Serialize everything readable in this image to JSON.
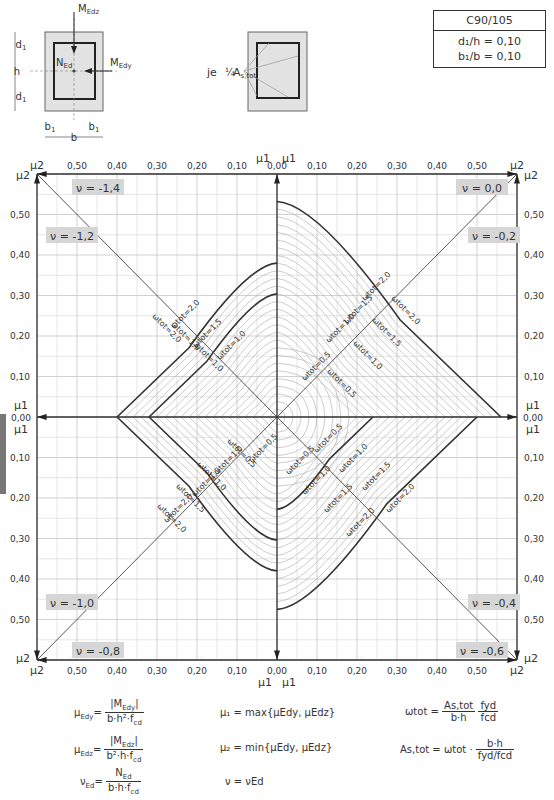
{
  "material_box": {
    "concrete_class": "C90/105",
    "ratio_d1_h": "d₁/h = 0,10",
    "ratio_b1_b": "b₁/b = 0,10"
  },
  "section_sketch": {
    "labels": {
      "mz": "M",
      "mz_sub": "Edz",
      "my": "M",
      "my_sub": "Edy",
      "n": "N",
      "n_sub": "Ed",
      "h": "h",
      "d1": "d",
      "b": "b",
      "b1": "b"
    },
    "reinforcement_label": "je",
    "reinforcement_fraction": "¼",
    "reinforcement_as": "A",
    "reinforcement_as_sub": "s,tot"
  },
  "chart_data": {
    "type": "line",
    "xlabel": "μ1 / μ2",
    "ylabel": "μ1 / μ2",
    "axis_range": [
      0.0,
      0.6
    ],
    "grid": true,
    "tick_labels": [
      "0,00",
      "0,10",
      "0,20",
      "0,30",
      "0,40",
      "0,50"
    ],
    "axis_end_labels": {
      "top_left": "μ2",
      "top_right": "μ2",
      "bottom_left": "μ2",
      "bottom_right": "μ2",
      "center": "μ1"
    },
    "quadrants": [
      {
        "position": "top-right",
        "nu_labels": [
          "ν = 0,0",
          "ν = -0,2"
        ]
      },
      {
        "position": "top-left",
        "nu_labels": [
          "ν = -1,4",
          "ν = -1,2"
        ]
      },
      {
        "position": "bottom-left",
        "nu_labels": [
          "ν = -1,0",
          "ν = -0,8"
        ]
      },
      {
        "position": "bottom-right",
        "nu_labels": [
          "ν = -0,4",
          "ν = -0,6"
        ]
      }
    ],
    "series": [
      {
        "name": "ω_tot = 0,5",
        "label": "ωtot = 0,5"
      },
      {
        "name": "ω_tot = 1,0",
        "label": "ωtot = 1,0"
      },
      {
        "name": "ω_tot = 1,5",
        "label": "ωtot = 1,5"
      },
      {
        "name": "ω_tot = 2,0",
        "label": "ωtot = 2,0"
      }
    ],
    "envelope_intercepts_mu1": {
      "nu_0.0_top_axis": 0.55,
      "omega_2.0_right": 0.56,
      "omega_1.5_right": 0.47,
      "omega_1.0_right": 0.39,
      "omega_0.5_right": 0.11,
      "omega_2.0_left": 0.4,
      "omega_1.5_left": 0.32,
      "omega_1.0_left": 0.19
    },
    "omega_label_text": "ω",
    "omega_label_sub": "tot"
  },
  "formulas": {
    "mu_edy_lhs": "μ",
    "mu_edy_lhs_sub": "Edy",
    "mu_edy_num": "|M",
    "mu_edy_num_sub": "Edy",
    "mu_edy_den": "b·h²·f",
    "mu_edz_lhs": "μ",
    "mu_edz_lhs_sub": "Edz",
    "mu_edz_num": "|M",
    "mu_edz_num_sub": "Edz",
    "mu_edz_den": "b²·h·f",
    "nu_ed_lhs": "ν",
    "nu_ed_lhs_sub": "Ed",
    "nu_ed_num": "N",
    "nu_ed_num_sub": "Ed",
    "nu_ed_den": "b·h·f",
    "cd": "cd",
    "mu1_def": "μ₁ = max{μEdy, μEdz}",
    "mu2_def": "μ₂ = min{μEdy, μEdz}",
    "nu_def": "ν = νEd",
    "omega_def_lhs": "ωtot =",
    "omega_def_num1": "As,tot",
    "omega_def_den1": "b·h",
    "omega_def_num2": "fyd",
    "omega_def_den2": "fcd",
    "as_def_lhs": "As,tot = ωtot ·",
    "as_def_num": "b·h",
    "as_def_den": "fyd/fcd"
  }
}
